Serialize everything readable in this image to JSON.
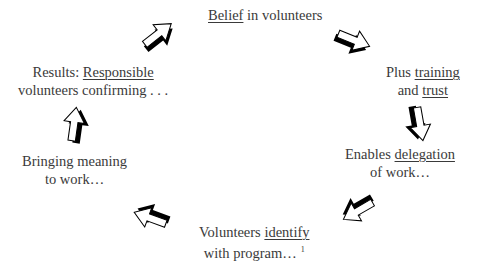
{
  "diagram": {
    "nodes": [
      {
        "id": "belief",
        "line1_pre": "",
        "line1_u": "Belief",
        "line1_post": " in volunteers",
        "line2_pre": "",
        "line2_u": "",
        "line2_post": ""
      },
      {
        "id": "training",
        "line1_pre": "Plus ",
        "line1_u": "training",
        "line1_post": "",
        "line2_pre": "and ",
        "line2_u": "trust",
        "line2_post": ""
      },
      {
        "id": "delegation",
        "line1_pre": "Enables ",
        "line1_u": "delegation",
        "line1_post": "",
        "line2_pre": "of work…",
        "line2_u": "",
        "line2_post": ""
      },
      {
        "id": "identify",
        "line1_pre": "Volunteers ",
        "line1_u": "identify",
        "line1_post": "",
        "line2_pre": "with program…",
        "line2_u": "",
        "line2_post": "",
        "footnote": "1"
      },
      {
        "id": "meaning",
        "line1_pre": "Bringing meaning",
        "line1_u": "",
        "line1_post": "",
        "line2_pre": "to work…",
        "line2_u": "",
        "line2_post": ""
      },
      {
        "id": "results",
        "line1_pre": "Results: ",
        "line1_u": "Responsible",
        "line1_post": "",
        "line2_pre": "volunteers confirming . . .",
        "line2_u": "",
        "line2_post": ""
      }
    ],
    "arrows": [
      {
        "from": "belief",
        "to": "training",
        "direction": "down-right"
      },
      {
        "from": "training",
        "to": "delegation",
        "direction": "down"
      },
      {
        "from": "delegation",
        "to": "identify",
        "direction": "down-left"
      },
      {
        "from": "identify",
        "to": "meaning",
        "direction": "left-up"
      },
      {
        "from": "meaning",
        "to": "results",
        "direction": "up"
      },
      {
        "from": "results",
        "to": "belief",
        "direction": "up-right"
      }
    ],
    "colors": {
      "text": "#3a3a3a",
      "arrow_fill": "#ffffff",
      "arrow_shadow": "#000000"
    }
  }
}
